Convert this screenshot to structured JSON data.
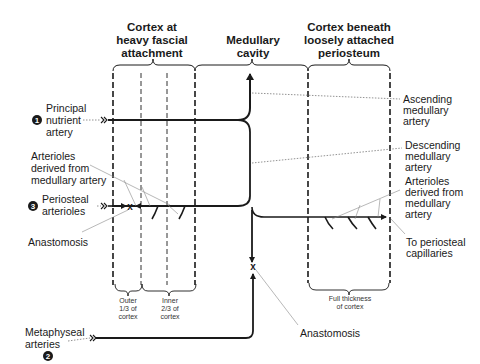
{
  "headers": {
    "left_cortex": [
      "Cortex at",
      "heavy fascial",
      "attachment"
    ],
    "medullary": [
      "Medullary",
      "cavity"
    ],
    "right_cortex": [
      "Cortex beneath",
      "loosely attached",
      "periosteum"
    ]
  },
  "left_labels": {
    "principal_nutrient": {
      "number": "1",
      "lines": [
        "Principal",
        "nutrient",
        "artery"
      ]
    },
    "arterioles_derived": {
      "lines": [
        "Arterioles",
        "derived from",
        "medullary artery"
      ]
    },
    "periosteal_arterioles": {
      "number": "3",
      "lines": [
        "Periosteal",
        "arterioles"
      ]
    },
    "anastomosis": {
      "lines": [
        "Anastomosis"
      ]
    },
    "metaphyseal": {
      "number": "2",
      "lines": [
        "Metaphyseal",
        "arteries"
      ]
    }
  },
  "right_labels": {
    "ascending": {
      "lines": [
        "Ascending",
        "medullary",
        "artery"
      ]
    },
    "descending": {
      "lines": [
        "Descending",
        "medullary",
        "artery"
      ]
    },
    "arterioles_derived": {
      "lines": [
        "Arterioles",
        "derived from",
        "medullary",
        "artery"
      ]
    },
    "to_periosteal": {
      "lines": [
        "To periosteal",
        "capillaries"
      ]
    }
  },
  "bottom_labels": {
    "outer": [
      "Outer",
      "1/3 of",
      "cortex"
    ],
    "inner": [
      "Inner",
      "2/3 of",
      "cortex"
    ],
    "full": [
      "Full thickness",
      "of cortex"
    ],
    "anastomosis": "Anastomosis",
    "anastomosis_mark": "x",
    "periosteal_mark": "x"
  },
  "colors": {
    "line": "#1a1a1a",
    "leader": "#777777",
    "background": "#ffffff"
  }
}
